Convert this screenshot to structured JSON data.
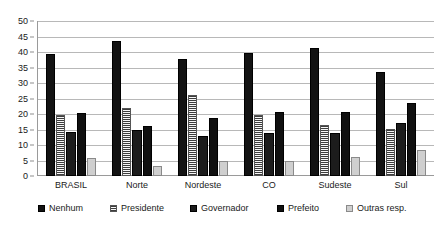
{
  "chart_data": {
    "type": "bar",
    "title": "",
    "subtitle": "",
    "xlabel": "",
    "ylabel": "",
    "ylim": [
      0,
      50
    ],
    "ytick_step": 5,
    "yticks": [
      0,
      5,
      10,
      15,
      20,
      25,
      30,
      35,
      40,
      45,
      50
    ],
    "grid": true,
    "legend_position": "bottom",
    "categories": [
      "BRASIL",
      "Norte",
      "Nordeste",
      "CO",
      "Sudeste",
      "Sul"
    ],
    "series": [
      {
        "name": "Nenhum",
        "swatch": "solid-black",
        "color": "#131313",
        "values": [
          39.5,
          43.5,
          37.6,
          39.8,
          41.4,
          33.6
        ]
      },
      {
        "name": "Presidente",
        "swatch": "horizontal-lines",
        "color": "#f2f2f2",
        "values": [
          19.8,
          22.0,
          26.0,
          19.8,
          16.5,
          15.3
        ]
      },
      {
        "name": "Governador",
        "swatch": "dark-gray",
        "color": "#1c1c1c",
        "values": [
          14.3,
          15.0,
          12.8,
          13.9,
          13.9,
          17.2
        ]
      },
      {
        "name": "Prefeito",
        "swatch": "dark-gray",
        "color": "#101010",
        "values": [
          20.4,
          16.2,
          18.6,
          20.5,
          20.8,
          23.7
        ]
      },
      {
        "name": "Outras resp.",
        "swatch": "light-gray",
        "color": "#cfcfcf",
        "values": [
          5.8,
          3.2,
          4.7,
          4.8,
          6.0,
          8.4
        ]
      }
    ]
  },
  "axis": {
    "y_tick_labels": [
      "50",
      "45",
      "40",
      "35",
      "30",
      "25",
      "20",
      "15",
      "10",
      "5",
      "0"
    ]
  },
  "legend": {
    "items": [
      {
        "label": "Nenhum"
      },
      {
        "label": "Presidente"
      },
      {
        "label": "Governador"
      },
      {
        "label": "Prefeito"
      },
      {
        "label": "Outras resp."
      }
    ]
  }
}
